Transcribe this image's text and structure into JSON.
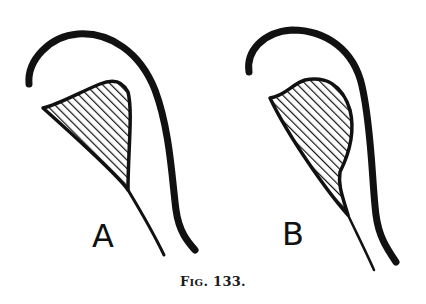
{
  "figure": {
    "caption_prefix": "F",
    "caption_smallcaps": "IG",
    "caption_rest": ". 133.",
    "panels": [
      {
        "label": "A"
      },
      {
        "label": "B"
      }
    ],
    "colors": {
      "ink": "#111111",
      "paper": "#ffffff"
    }
  }
}
